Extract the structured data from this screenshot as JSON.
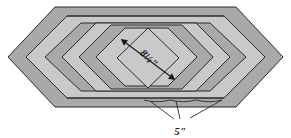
{
  "figure": {
    "type": "technical-line-diagram",
    "canvas": {
      "width": 291,
      "height": 138
    },
    "background_color": "#ffffff"
  },
  "colors": {
    "outer_border_fill": "#a9a9a9",
    "band_fill_dark": "#a9a9a9",
    "band_fill_light": "#c9c9c9",
    "center_fill": "#c9c9c9",
    "stroke": "#2b2b2b",
    "text": "#1a1a1a",
    "page_background": "#ffffff"
  },
  "labels": {
    "center_dimension": {
      "text": "8½\"",
      "name": "center-diamond-dimension",
      "rotation_degrees": 45,
      "x": 148,
      "y": 59
    },
    "border_width": {
      "text": "5\"",
      "name": "border-width-dimension",
      "x": 180,
      "y": 127,
      "leader_count": 3
    }
  },
  "shapes": {
    "outer_hexagon": {
      "name": "outer-hexagon",
      "points": "8,57 55,7 236,7 283,57 236,107 55,107",
      "fill": "#a9a9a9"
    },
    "bands": [
      {
        "name": "band-1-light",
        "points": "26,57 67,16 224,16 265,57 224,98 67,98",
        "fill": "#c9c9c9"
      },
      {
        "name": "band-2-dark",
        "points": "45,57 81,23 210,23 246,57 210,91 81,91",
        "fill": "#a9a9a9"
      },
      {
        "name": "band-3-light",
        "points": "62,57 96,23 196,23 230,57 196,91 96,91",
        "fill": "#c9c9c9"
      },
      {
        "name": "band-4-dark",
        "points": "79,57 111,25 182,25 213,57 182,89 111,89",
        "fill": "#a9a9a9"
      },
      {
        "name": "band-5-light",
        "points": "96,57 125,28 168,28 197,57 168,86 125,86",
        "fill": "#c9c9c9"
      },
      {
        "name": "center-diamond",
        "points": "117,58 148,28 179,58 148,88",
        "fill": "#c9c9c9"
      }
    ],
    "top_edge_line": {
      "name": "top-inner-edge-line",
      "x1": 67,
      "y1": 16,
      "x2": 224,
      "y2": 16
    },
    "bottom_edge_line": {
      "name": "bottom-inner-edge-line",
      "x1": 67,
      "y1": 98,
      "x2": 224,
      "y2": 98
    }
  },
  "arrows": {
    "center_diagonal": {
      "name": "center-dimension-arrow",
      "x1": 126,
      "y1": 43,
      "x2": 170,
      "y2": 76,
      "double_headed": true
    }
  },
  "leaders": [
    {
      "name": "leader-line-1",
      "x1": 174,
      "y1": 119,
      "x2": 150,
      "y2": 101
    },
    {
      "name": "leader-line-2",
      "x1": 180,
      "y1": 119,
      "x2": 176,
      "y2": 101
    },
    {
      "name": "leader-line-3",
      "x1": 190,
      "y1": 118,
      "x2": 222,
      "y2": 100
    }
  ],
  "scallops": [
    {
      "name": "scallop-segment-1",
      "x1": 144,
      "x2": 170,
      "y": 100
    },
    {
      "name": "scallop-segment-2",
      "x1": 170,
      "x2": 196,
      "y": 100
    },
    {
      "name": "scallop-segment-3",
      "x1": 196,
      "x2": 222,
      "y": 100
    }
  ]
}
